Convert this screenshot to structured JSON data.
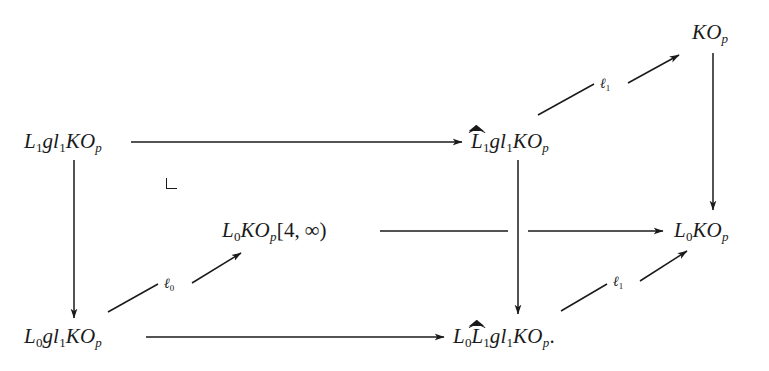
{
  "diagram": {
    "type": "commutative-diagram",
    "background_color": "#ffffff",
    "ink_color": "#1a1a1a",
    "nodes": [
      {
        "id": "top-left",
        "latex": "L_1 gl_1 KO_p",
        "plain": "L1gl1KOp",
        "x": 24,
        "y": 131
      },
      {
        "id": "top-middle",
        "latex": "\\widehat{L}_1 gl_1 KO_p",
        "plain": "L^1gl1KOp",
        "x": 471,
        "y": 131
      },
      {
        "id": "top-right",
        "latex": "KO_p",
        "plain": "KOp",
        "x": 692,
        "y": 22
      },
      {
        "id": "center",
        "latex": "L_0 KO_p[4,\\infty)",
        "plain": "L0KOp[4,inf)",
        "x": 222,
        "y": 220
      },
      {
        "id": "right-middle",
        "latex": "L_0 KO_p",
        "plain": "L0KOp",
        "x": 674,
        "y": 220
      },
      {
        "id": "bottom-left",
        "latex": "L_0 gl_1 KO_p",
        "plain": "L0gl1KOp",
        "x": 24,
        "y": 326
      },
      {
        "id": "bottom-middle",
        "latex": "L_0 \\widehat{L}_1 gl_1 KO_p.",
        "plain": "L0L^1gl1KOp.",
        "x": 453,
        "y": 326
      }
    ],
    "arrows": [
      {
        "id": "top-horizontal",
        "from": "top-left",
        "to": "top-middle",
        "label": ""
      },
      {
        "id": "bottom-horizontal",
        "from": "bottom-left",
        "to": "bottom-middle",
        "label": ""
      },
      {
        "id": "left-vertical",
        "from": "top-left",
        "to": "bottom-left",
        "label": ""
      },
      {
        "id": "middle-vertical",
        "from": "top-middle",
        "to": "bottom-middle",
        "label": ""
      },
      {
        "id": "right-vertical",
        "from": "top-right",
        "to": "right-middle",
        "label": ""
      },
      {
        "id": "center-horizontal",
        "from": "center",
        "to": "right-middle",
        "label": ""
      },
      {
        "id": "upper-diagonal",
        "from": "top-middle",
        "to": "top-right",
        "label": "l1"
      },
      {
        "id": "lower-left-diagonal",
        "from": "bottom-left",
        "to": "center",
        "label": "l0"
      },
      {
        "id": "lower-right-diagonal",
        "from": "bottom-middle",
        "to": "right-middle",
        "label": "l1"
      }
    ],
    "labels": {
      "ell_one": "ℓ",
      "ell_one_sub": "1",
      "ell_zero": "ℓ",
      "ell_zero_sub": "0"
    },
    "pullback_marker": {
      "present": true,
      "x": 166,
      "y": 178,
      "meaning": "homotopy-pullback-square-corner"
    }
  }
}
